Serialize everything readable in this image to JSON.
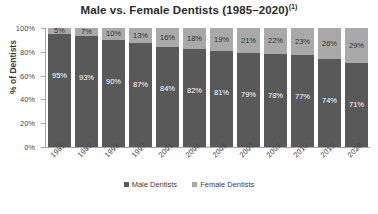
{
  "chart_data": {
    "type": "bar",
    "subtype": "stacked-100-percent",
    "title": "Male vs. Female Dentists (1985–2020)",
    "title_superscript": "(1)",
    "xlabel": "",
    "ylabel": "% of Dentists",
    "ylim": [
      0,
      100
    ],
    "ytick_labels": [
      "100%",
      "80%",
      "60%",
      "40%",
      "20%",
      "0%"
    ],
    "ytick_values": [
      100,
      80,
      60,
      40,
      20,
      0
    ],
    "grid": false,
    "legend_position": "bottom-center",
    "categories": [
      "1985",
      "1989",
      "1993",
      "1997",
      "2001",
      "2003",
      "2005",
      "2007",
      "2009",
      "2010",
      "2015",
      "2020"
    ],
    "series": [
      {
        "name": "Male Dentists",
        "color": "#595959",
        "values": [
          95,
          93,
          90,
          87,
          84,
          82,
          81,
          79,
          78,
          77,
          74,
          71
        ],
        "labels": [
          "95%",
          "93%",
          "90%",
          "87%",
          "84%",
          "82%",
          "81%",
          "79%",
          "78%",
          "77%",
          "74%",
          "71%"
        ]
      },
      {
        "name": "Female Dentists",
        "color": "#a9a9a9",
        "values": [
          5,
          7,
          10,
          13,
          16,
          18,
          19,
          21,
          22,
          23,
          26,
          29
        ],
        "labels": [
          "5%",
          "7%",
          "10%",
          "13%",
          "16%",
          "18%",
          "19%",
          "21%",
          "22%",
          "23%",
          "26%",
          "29%"
        ]
      }
    ]
  },
  "legend": {
    "items": [
      {
        "label": "Male Dentists",
        "key": "male"
      },
      {
        "label": "Female Dentists",
        "key": "female"
      }
    ]
  },
  "colors": {
    "male": "#595959",
    "female": "#a9a9a9",
    "axis": "#a6a6a6",
    "text": "#3c3c3c",
    "background": "#ffffff"
  }
}
